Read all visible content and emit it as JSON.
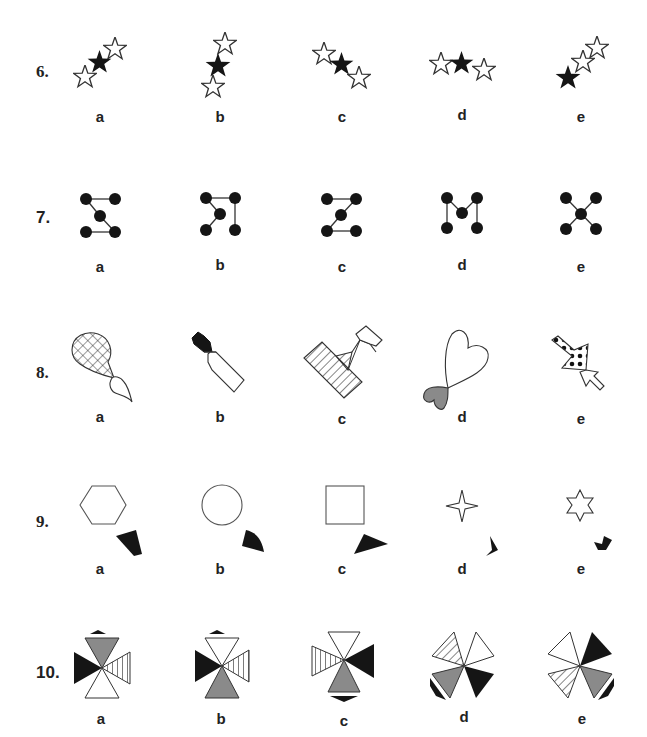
{
  "questions": [
    {
      "number": "6.",
      "options": [
        "a",
        "b",
        "c",
        "d",
        "e"
      ],
      "theme": "three stars, one black"
    },
    {
      "number": "7.",
      "options": [
        "a",
        "b",
        "c",
        "d",
        "e"
      ],
      "theme": "five dots connected by lines"
    },
    {
      "number": "8.",
      "options": [
        "a",
        "b",
        "c",
        "d",
        "e"
      ],
      "theme": "two joined patterned shapes"
    },
    {
      "number": "9.",
      "options": [
        "a",
        "b",
        "c",
        "d",
        "e"
      ],
      "theme": "outline shape with black fragment"
    },
    {
      "number": "10.",
      "options": [
        "a",
        "b",
        "c",
        "d",
        "e"
      ],
      "theme": "four triangles pinwheel"
    }
  ],
  "colors": {
    "black": "#151515",
    "gray": "#8a8a8a",
    "stroke": "#333333",
    "white": "#ffffff"
  }
}
